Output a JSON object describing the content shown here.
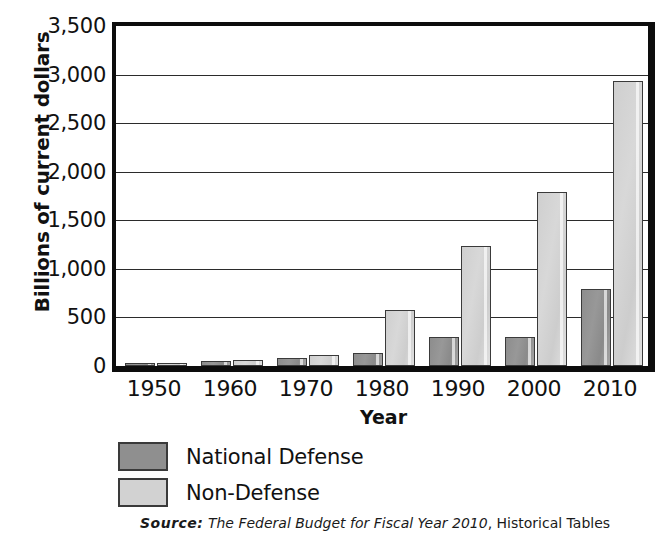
{
  "chart_data": {
    "type": "bar",
    "title": "",
    "xlabel": "Year",
    "ylabel": "Billions of current dollars",
    "categories": [
      "1950",
      "1960",
      "1970",
      "1980",
      "1990",
      "2000",
      "2010"
    ],
    "series": [
      {
        "name": "National Defense",
        "color": "#8f8f8f",
        "values": [
          13,
          48,
          82,
          134,
          300,
          295,
          794
        ]
      },
      {
        "name": "Non-Defense",
        "color": "#d2d2d2",
        "values": [
          29,
          60,
          113,
          580,
          1240,
          1790,
          2930
        ]
      }
    ],
    "ylim": [
      0,
      3500
    ],
    "ytick_values": [
      0,
      500,
      1000,
      1500,
      2000,
      2500,
      3000,
      3500
    ],
    "ytick_labels": [
      "0",
      "500",
      "1,000",
      "1,500",
      "2,000",
      "2,500",
      "3,000",
      "3,500"
    ],
    "grid": true,
    "legend_position": "below-axes"
  },
  "legend": {
    "items": [
      {
        "label": "National Defense",
        "color": "#8f8f8f"
      },
      {
        "label": "Non-Defense",
        "color": "#d2d2d2"
      }
    ]
  },
  "source": {
    "prefix": "Source:",
    "title": "The Federal Budget for Fiscal Year 2010",
    "tail": ", Historical Tables"
  }
}
